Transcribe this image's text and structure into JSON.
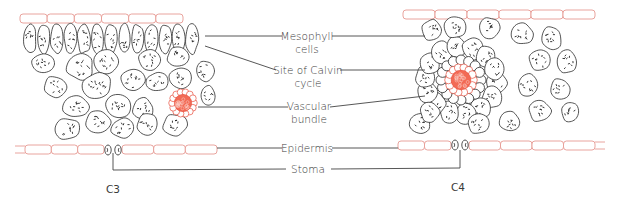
{
  "diagram": {
    "labels": {
      "mesophyll": [
        "Mesophyll",
        "cells"
      ],
      "calvin": [
        "Site of Calvin",
        "cycle"
      ],
      "vascular": [
        "Vascular",
        "bundle"
      ],
      "epidermis": "Epidermis",
      "stoma": "Stoma"
    },
    "panels": {
      "left": "C3",
      "right": "C4"
    },
    "colors": {
      "epidermis_outline": "#e79a93",
      "vascular_fill": "#f26a55",
      "cell_outline": "#2a2a2a",
      "leader_line": "#444444",
      "text": "#3a3a3a"
    }
  }
}
